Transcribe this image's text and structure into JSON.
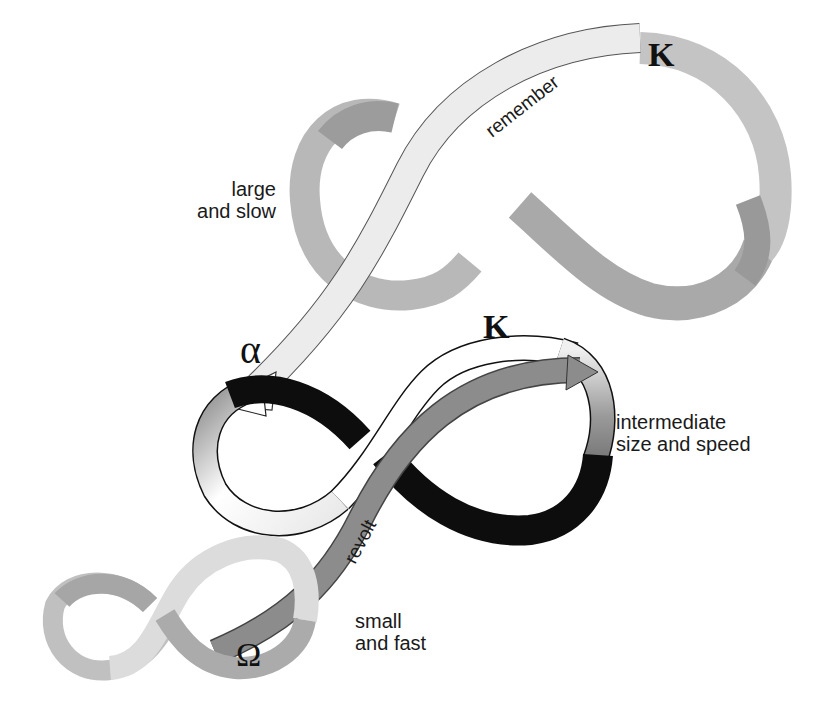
{
  "diagram": {
    "title": "",
    "levels": [
      {
        "id": "large",
        "label_line1": "large",
        "label_line2": "and slow",
        "fill_color": "#b5b5b5",
        "dark_fill_color": "#9a9a9a",
        "symbol": "K"
      },
      {
        "id": "intermediate",
        "label_line1": "intermediate",
        "label_line2": "size and speed",
        "fill_color": "#111111",
        "light_fill_color": "#d8d8d8",
        "symbol_left": "α",
        "symbol_right": "K"
      },
      {
        "id": "small",
        "label_line1": "small",
        "label_line2": "and fast",
        "fill_color": "#cfcfcf",
        "dark_fill_color": "#a8a8a8",
        "symbol": "Ω"
      }
    ],
    "connectors": [
      {
        "id": "remember",
        "label": "remember",
        "from": "K (large)",
        "to": "α (intermediate)",
        "color": "#e6e6e6"
      },
      {
        "id": "revolt",
        "label": "revolt",
        "from": "Ω (small)",
        "to": "K (intermediate)",
        "color": "#8a8a8a"
      }
    ],
    "symbols": {
      "k_top": "K",
      "k_mid": "K",
      "alpha": "α",
      "omega": "Ω"
    }
  }
}
